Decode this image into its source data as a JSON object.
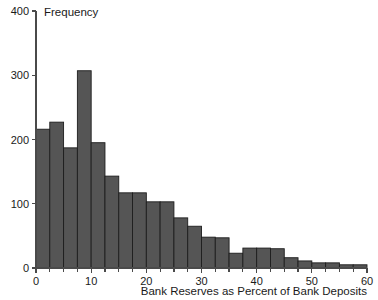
{
  "chart_data": {
    "type": "bar",
    "title": "",
    "subtitle": "",
    "xlabel": "Bank Reserves as Percent of Bank Deposits",
    "ylabel": "Frequency",
    "xlim": [
      0,
      60
    ],
    "ylim": [
      0,
      400
    ],
    "xticks": [
      0,
      10,
      20,
      30,
      40,
      50,
      60
    ],
    "xtick_labels": [
      "0",
      "10",
      "20",
      "30",
      "40",
      "50",
      "60"
    ],
    "xminor_ticks": [
      2.5,
      5,
      7.5,
      12.5,
      15,
      17.5,
      22.5,
      25,
      27.5,
      32.5,
      35,
      37.5,
      42.5,
      45,
      47.5,
      52.5,
      55,
      57.5
    ],
    "yticks": [
      0,
      100,
      200,
      300,
      400
    ],
    "ytick_labels": [
      "0",
      "100",
      "200",
      "300",
      "400"
    ],
    "grid": false,
    "legend": null,
    "legend_position": "none",
    "bar_color": "#555555",
    "bar_edge_color": "#1d1d1d",
    "axis_color": "#4a4a4a",
    "bin_width": 2.5,
    "bins": [
      {
        "x0": 0,
        "x1": 2.5,
        "value": 216
      },
      {
        "x0": 2.5,
        "x1": 5,
        "value": 227
      },
      {
        "x0": 5,
        "x1": 7.5,
        "value": 187
      },
      {
        "x0": 7.5,
        "x1": 10,
        "value": 307
      },
      {
        "x0": 10,
        "x1": 12.5,
        "value": 195
      },
      {
        "x0": 12.5,
        "x1": 15,
        "value": 143
      },
      {
        "x0": 15,
        "x1": 17.5,
        "value": 117
      },
      {
        "x0": 17.5,
        "x1": 20,
        "value": 117
      },
      {
        "x0": 20,
        "x1": 22.5,
        "value": 103
      },
      {
        "x0": 22.5,
        "x1": 25,
        "value": 103
      },
      {
        "x0": 25,
        "x1": 27.5,
        "value": 78
      },
      {
        "x0": 27.5,
        "x1": 30,
        "value": 65
      },
      {
        "x0": 30,
        "x1": 32.5,
        "value": 48
      },
      {
        "x0": 32.5,
        "x1": 35,
        "value": 47
      },
      {
        "x0": 35,
        "x1": 37.5,
        "value": 23
      },
      {
        "x0": 37.5,
        "x1": 40,
        "value": 31
      },
      {
        "x0": 40,
        "x1": 42.5,
        "value": 31
      },
      {
        "x0": 42.5,
        "x1": 45,
        "value": 30
      },
      {
        "x0": 45,
        "x1": 47.5,
        "value": 16
      },
      {
        "x0": 47.5,
        "x1": 50,
        "value": 11
      },
      {
        "x0": 50,
        "x1": 52.5,
        "value": 8
      },
      {
        "x0": 52.5,
        "x1": 55,
        "value": 8
      },
      {
        "x0": 55,
        "x1": 57.5,
        "value": 5
      },
      {
        "x0": 57.5,
        "x1": 60,
        "value": 5
      }
    ]
  }
}
